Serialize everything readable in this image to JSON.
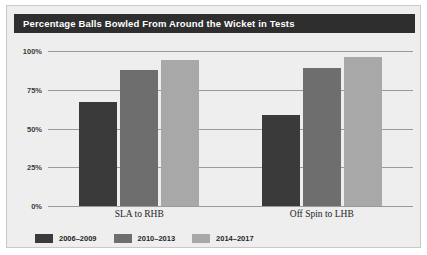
{
  "title": "Percentage Balls Bowled From Around the Wicket in Tests",
  "colors": {
    "series_1": "#3a3a3a",
    "series_2": "#6e6e6e",
    "series_3": "#a8a8a8",
    "title_bar": "#2e2e2e",
    "panel": "#eeeeee",
    "gridline": "#9a9a9a"
  },
  "legend": {
    "items": [
      {
        "label": "2006–2009",
        "color": "#3a3a3a"
      },
      {
        "label": "2010–2013",
        "color": "#6e6e6e"
      },
      {
        "label": "2014–2017",
        "color": "#a8a8a8"
      }
    ]
  },
  "chart_data": {
    "type": "bar",
    "title": "Percentage Balls Bowled From Around the Wicket in Tests",
    "xlabel": "",
    "ylabel": "",
    "ylim": [
      0,
      100
    ],
    "yticks": [
      "0%",
      "25%",
      "50%",
      "75%",
      "100%"
    ],
    "ytick_values": [
      0,
      25,
      50,
      75,
      100
    ],
    "grid": true,
    "legend_position": "bottom-left",
    "categories": [
      "SLA to RHB",
      "Off Spin to LHB"
    ],
    "series": [
      {
        "name": "2006–2009",
        "color": "#3a3a3a",
        "values": [
          67,
          59
        ]
      },
      {
        "name": "2010–2013",
        "color": "#6e6e6e",
        "values": [
          88,
          89
        ]
      },
      {
        "name": "2014–2017",
        "color": "#a8a8a8",
        "values": [
          94,
          96
        ]
      }
    ]
  }
}
